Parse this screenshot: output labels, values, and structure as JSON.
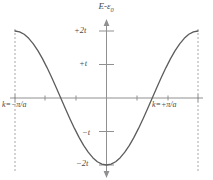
{
  "figure": {
    "axis_title": "E - ε0",
    "axis_title_main": "E",
    "axis_title_minus": "-",
    "axis_title_eps": "ε",
    "axis_title_sub": "0"
  },
  "labels": {
    "y_plus_2t": "+2t",
    "y_plus_t": "+t",
    "y_minus_t": "−t",
    "y_minus_2t": "−2t",
    "x_left": "k=−π/a",
    "x_right": "k=+π/a"
  },
  "colors": {
    "curve": "#5c5c5c",
    "axis": "#8c8c8c",
    "dashed": "#a0a0a0",
    "text": "#3a3a3a",
    "background": "#ffffff"
  },
  "chart_data": {
    "type": "line",
    "xlabel": "k",
    "ylabel": "E - ε0",
    "grid": false,
    "legend": null,
    "xlim": [
      -3.141592653589793,
      3.141592653589793
    ],
    "ylim": [
      -2,
      2
    ],
    "xtick_labels": [
      "k=−π/a",
      "k=+π/a"
    ],
    "xtick_values": [
      -3.141592653589793,
      3.141592653589793
    ],
    "ytick_labels": [
      "+2t",
      "+t",
      "−t",
      "−2t"
    ],
    "ytick_values": [
      2,
      1,
      -1,
      -2
    ],
    "annotations": [
      "dashed vertical lines at k = −π/a and k = +π/a (Brillouin zone boundaries)"
    ],
    "equation": "E - ε0 = -2t cos(ka)",
    "series": [
      {
        "name": "tight-binding band",
        "x": [
          -3.1416,
          -2.9845,
          -2.8274,
          -2.6704,
          -2.5133,
          -2.3562,
          -2.1991,
          -2.042,
          -1.885,
          -1.7279,
          -1.5708,
          -1.4137,
          -1.2566,
          -1.0996,
          -0.9425,
          -0.7854,
          -0.6283,
          -0.4712,
          -0.3142,
          -0.1571,
          0,
          0.1571,
          0.3142,
          0.4712,
          0.6283,
          0.7854,
          0.9425,
          1.0996,
          1.2566,
          1.4137,
          1.5708,
          1.7279,
          1.885,
          2.042,
          2.1991,
          2.3562,
          2.5133,
          2.6704,
          2.8274,
          2.9845,
          3.1416
        ],
        "y": [
          2.0,
          1.9754,
          1.9021,
          1.782,
          1.618,
          1.4142,
          1.1756,
          0.908,
          0.618,
          0.3129,
          0.0,
          -0.3129,
          -0.618,
          -0.908,
          -1.1756,
          -1.4142,
          -1.618,
          -1.782,
          -1.9021,
          -1.9754,
          -2.0,
          -1.9754,
          -1.9021,
          -1.782,
          -1.618,
          -1.4142,
          -1.1756,
          -0.908,
          -0.618,
          -0.3129,
          0.0,
          0.3129,
          0.618,
          0.908,
          1.1756,
          1.4142,
          1.618,
          1.782,
          1.9021,
          1.9754,
          2.0
        ]
      }
    ]
  }
}
